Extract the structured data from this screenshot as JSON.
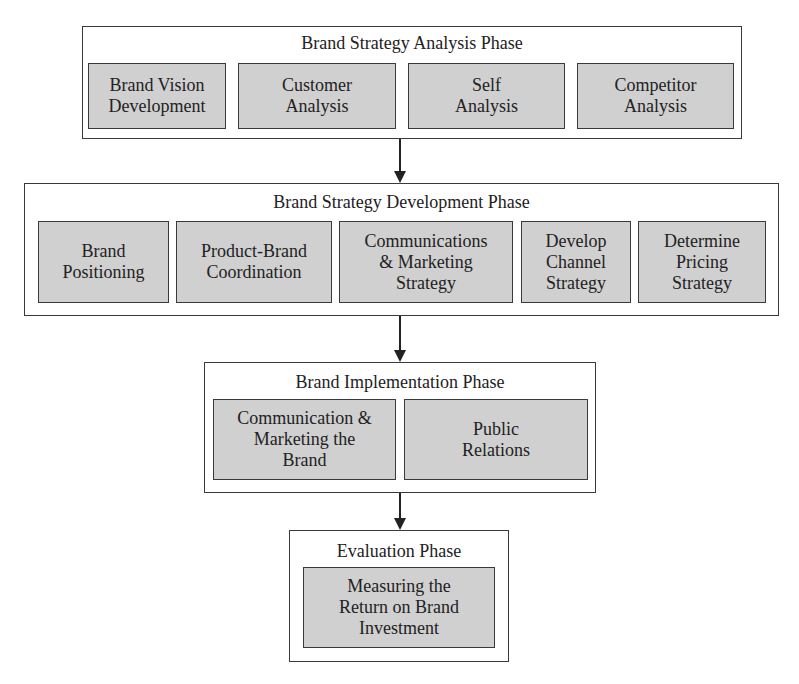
{
  "phases": [
    {
      "title": "Brand Strategy Analysis Phase",
      "steps": [
        "Brand Vision\nDevelopment",
        "Customer\nAnalysis",
        "Self\nAnalysis",
        "Competitor\nAnalysis"
      ]
    },
    {
      "title": "Brand Strategy Development Phase",
      "steps": [
        "Brand\nPositioning",
        "Product-Brand\nCoordination",
        "Communications\n& Marketing\nStrategy",
        "Develop\nChannel\nStrategy",
        "Determine\nPricing\nStrategy"
      ]
    },
    {
      "title": "Brand Implementation Phase",
      "steps": [
        "Communication &\nMarketing the\nBrand",
        "Public\nRelations"
      ]
    },
    {
      "title": "Evaluation Phase",
      "steps": [
        "Measuring the\nReturn on Brand\nInvestment"
      ]
    }
  ],
  "colors": {
    "step_fill": "#d0d0d0",
    "border": "#3a3a3a",
    "background": "#ffffff"
  }
}
